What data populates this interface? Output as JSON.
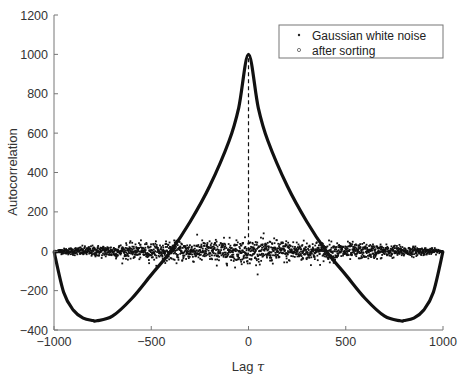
{
  "chart_data": {
    "type": "scatter",
    "title": "",
    "xlabel": "Lag τ",
    "xlabel_text": "Lag ",
    "xlabel_symbol": "τ",
    "ylabel": "Autocorrelation",
    "xlim": [
      -1000,
      1000
    ],
    "ylim": [
      -400,
      1200
    ],
    "xticks": [
      -1000,
      -500,
      0,
      500,
      1000
    ],
    "xtick_labels": [
      "−1000",
      "−500",
      "0",
      "500",
      "1000"
    ],
    "yticks": [
      -400,
      -200,
      0,
      200,
      400,
      600,
      800,
      1000,
      1200
    ],
    "ytick_labels": [
      "−400",
      "−200",
      "0",
      "200",
      "400",
      "600",
      "800",
      "1000",
      "1200"
    ],
    "grid": false,
    "legend_position": "upper right",
    "series": [
      {
        "name": "Gaussian white noise",
        "marker": "dot",
        "description": "Autocorrelation of N=1000 Gaussian white noise: peak 1000 at lag 0 (dashed line), otherwise scatter around 0 with spread ≈ ±60 decreasing toward |τ|=1000",
        "peak": {
          "x": 0,
          "y": 1000
        },
        "noise_amplitude": 30
      },
      {
        "name": "after sorting",
        "marker": "circle",
        "description": "Autocorrelation after sorting: symmetric curve, 1000 at τ=0, crosses 0 near τ=±400, minimum ≈ −350 near τ=±780, returns to 0 at τ=±1000",
        "x": [
          -1000,
          -950,
          -900,
          -850,
          -800,
          -780,
          -700,
          -600,
          -500,
          -400,
          -300,
          -200,
          -100,
          -50,
          0,
          50,
          100,
          200,
          300,
          400,
          500,
          600,
          700,
          780,
          800,
          850,
          900,
          950,
          1000
        ],
        "y": [
          0,
          -210,
          -300,
          -340,
          -352,
          -353,
          -330,
          -240,
          -120,
          0,
          150,
          330,
          560,
          730,
          1000,
          730,
          560,
          330,
          150,
          0,
          -120,
          -240,
          -330,
          -353,
          -352,
          -340,
          -300,
          -210,
          0
        ]
      }
    ]
  },
  "legend": {
    "items": [
      {
        "label": "Gaussian white noise",
        "marker": "dot"
      },
      {
        "label": "after sorting",
        "marker": "circle"
      }
    ]
  }
}
